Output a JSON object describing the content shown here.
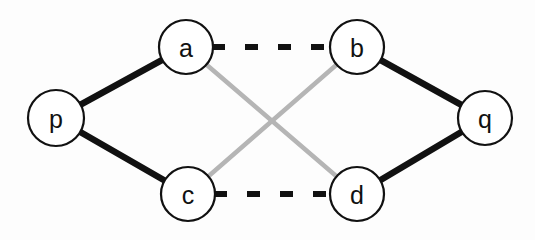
{
  "figure": {
    "title": "",
    "background_color": "#fdfdfd",
    "width": 535,
    "height": 240
  },
  "chart_data": {
    "type": "diagram",
    "diagram_kind": "graph",
    "title": "",
    "nodes": [
      {
        "id": "p",
        "label": "p",
        "x": 56,
        "y": 118,
        "r": 28,
        "fill": "#ffffff",
        "stroke": "#111111"
      },
      {
        "id": "a",
        "label": "a",
        "x": 186,
        "y": 47,
        "r": 27,
        "fill": "#ffffff",
        "stroke": "#111111"
      },
      {
        "id": "b",
        "label": "b",
        "x": 357,
        "y": 47,
        "r": 27,
        "fill": "#ffffff",
        "stroke": "#111111"
      },
      {
        "id": "c",
        "label": "c",
        "x": 188,
        "y": 194,
        "r": 27,
        "fill": "#ffffff",
        "stroke": "#111111"
      },
      {
        "id": "d",
        "label": "d",
        "x": 357,
        "y": 194,
        "r": 27,
        "fill": "#ffffff",
        "stroke": "#111111"
      },
      {
        "id": "q",
        "label": "q",
        "x": 485,
        "y": 118,
        "r": 27,
        "fill": "#ffffff",
        "stroke": "#111111"
      }
    ],
    "edges": [
      {
        "id": "p-a",
        "source": "p",
        "target": "a",
        "style": "solid",
        "color": "#111111",
        "width": 6.5
      },
      {
        "id": "p-c",
        "source": "p",
        "target": "c",
        "style": "solid",
        "color": "#111111",
        "width": 6.5
      },
      {
        "id": "b-q",
        "source": "b",
        "target": "q",
        "style": "solid",
        "color": "#111111",
        "width": 6.5
      },
      {
        "id": "d-q",
        "source": "d",
        "target": "q",
        "style": "solid",
        "color": "#111111",
        "width": 6.5
      },
      {
        "id": "a-b",
        "source": "a",
        "target": "b",
        "style": "dashed",
        "color": "#111111",
        "width": 6,
        "dash": "13 20"
      },
      {
        "id": "c-d",
        "source": "c",
        "target": "d",
        "style": "dashed",
        "color": "#111111",
        "width": 6,
        "dash": "13 20"
      },
      {
        "id": "a-d",
        "source": "a",
        "target": "d",
        "style": "solid",
        "color": "#b5b5b5",
        "width": 4.5
      },
      {
        "id": "b-c",
        "source": "b",
        "target": "c",
        "style": "solid",
        "color": "#b5b5b5",
        "width": 4.5
      }
    ],
    "legend": [],
    "annotations": []
  }
}
